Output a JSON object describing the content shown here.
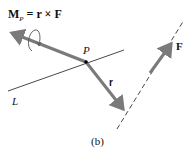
{
  "equation": {
    "M": "M",
    "sub": "P",
    "rest": " = r × F"
  },
  "labels": {
    "P": "P",
    "r": "r",
    "F": "F",
    "L": "L",
    "caption": "(b)"
  },
  "colors": {
    "vector": "#7a7a7a",
    "line": "#333333",
    "text": "#111111"
  }
}
